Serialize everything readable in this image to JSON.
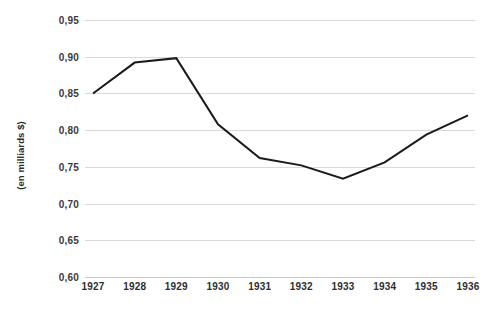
{
  "chart_data": {
    "type": "line",
    "title": "",
    "subtitle": "",
    "xlabel": "",
    "ylabel": "(en milliards $)",
    "categories": [
      "1927",
      "1928",
      "1929",
      "1930",
      "1931",
      "1932",
      "1933",
      "1934",
      "1935",
      "1936"
    ],
    "x": [
      1927,
      1928,
      1929,
      1930,
      1931,
      1932,
      1933,
      1934,
      1935,
      1936
    ],
    "values": [
      0.85,
      0.892,
      0.898,
      0.808,
      0.762,
      0.752,
      0.734,
      0.756,
      0.794,
      0.82
    ],
    "series": [
      {
        "name": "",
        "values": [
          0.85,
          0.892,
          0.898,
          0.808,
          0.762,
          0.752,
          0.734,
          0.756,
          0.794,
          0.82
        ]
      }
    ],
    "ylim": [
      0.6,
      0.95
    ],
    "ytick_values": [
      0.95,
      0.9,
      0.85,
      0.8,
      0.75,
      0.7,
      0.65,
      0.6
    ],
    "ytick_labels": [
      "0,95",
      "0,90",
      "0,85",
      "0,80",
      "0,75",
      "0,70",
      "0,65",
      "0,60"
    ],
    "xtick_labels": [
      "1927",
      "1928",
      "1929",
      "1930",
      "1931",
      "1932",
      "1933",
      "1934",
      "1935",
      "1936"
    ],
    "grid": {
      "horizontal": true,
      "vertical": false,
      "color": "#d9d9d9"
    },
    "legend": {
      "visible": false,
      "position": "none",
      "entries": []
    },
    "markers": false,
    "line_color": "#1a1a1a",
    "line_width": 2,
    "background_color": "#ffffff",
    "annotations": []
  }
}
